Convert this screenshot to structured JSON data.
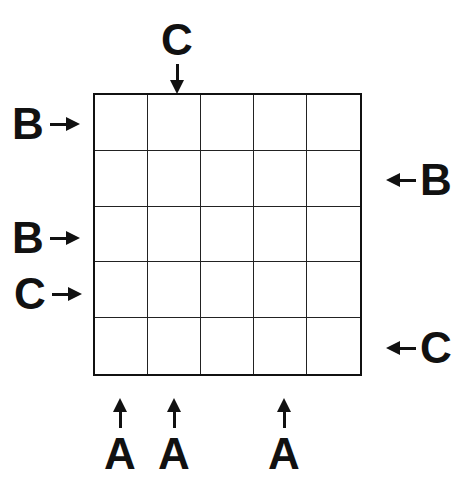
{
  "puzzle": {
    "grid_size": {
      "rows": 5,
      "cols": 5
    },
    "cells": [
      [
        "",
        "",
        "",
        "",
        ""
      ],
      [
        "",
        "",
        "",
        "",
        ""
      ],
      [
        "",
        "",
        "",
        "",
        ""
      ],
      [
        "",
        "",
        "",
        "",
        ""
      ],
      [
        "",
        "",
        "",
        "",
        ""
      ]
    ],
    "clues": {
      "top": {
        "col2": "C"
      },
      "left": {
        "row1": "B",
        "row3": "B",
        "row4": "C"
      },
      "right": {
        "row2": "B",
        "row5": "C"
      },
      "bottom": {
        "col1": "A",
        "col2": "A",
        "col4": "A"
      }
    }
  }
}
